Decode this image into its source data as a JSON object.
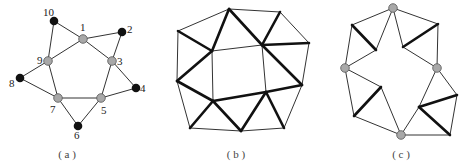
{
  "panels": [
    {
      "id": "a",
      "caption": "( a )",
      "caption_pos": [
        67,
        158
      ],
      "nodes": [
        {
          "id": "1",
          "label": "1",
          "x": 83,
          "y": 39,
          "color": "gray",
          "lx": 80,
          "ly": 31
        },
        {
          "id": "2",
          "label": "2",
          "x": 122,
          "y": 32,
          "color": "black",
          "lx": 127,
          "ly": 33
        },
        {
          "id": "3",
          "label": "3",
          "x": 112,
          "y": 61,
          "color": "gray",
          "lx": 117,
          "ly": 65
        },
        {
          "id": "4",
          "label": "4",
          "x": 136,
          "y": 88,
          "color": "black",
          "lx": 140,
          "ly": 92
        },
        {
          "id": "5",
          "label": "5",
          "x": 101,
          "y": 98,
          "color": "gray",
          "lx": 101,
          "ly": 114
        },
        {
          "id": "6",
          "label": "6",
          "x": 78,
          "y": 126,
          "color": "black",
          "lx": 74,
          "ly": 139
        },
        {
          "id": "7",
          "label": "7",
          "x": 58,
          "y": 98,
          "color": "gray",
          "lx": 50,
          "ly": 113
        },
        {
          "id": "8",
          "label": "8",
          "x": 20,
          "y": 78,
          "color": "black",
          "lx": 9,
          "ly": 87
        },
        {
          "id": "9",
          "label": "9",
          "x": 48,
          "y": 61,
          "color": "gray",
          "lx": 37,
          "ly": 64
        },
        {
          "id": "10",
          "label": "10",
          "x": 54,
          "y": 21,
          "color": "black",
          "lx": 43,
          "ly": 16
        }
      ],
      "edges": [
        [
          "10",
          "1"
        ],
        [
          "10",
          "9"
        ],
        [
          "1",
          "2"
        ],
        [
          "1",
          "9"
        ],
        [
          "1",
          "3"
        ],
        [
          "2",
          "3"
        ],
        [
          "3",
          "4"
        ],
        [
          "3",
          "5"
        ],
        [
          "4",
          "5"
        ],
        [
          "5",
          "7"
        ],
        [
          "5",
          "6"
        ],
        [
          "6",
          "7"
        ],
        [
          "7",
          "9"
        ],
        [
          "7",
          "8"
        ],
        [
          "8",
          "9"
        ]
      ]
    },
    {
      "id": "b",
      "caption": "( b )",
      "caption_pos": [
        236,
        158
      ],
      "points": {
        "T": [
          229,
          9
        ],
        "TR": [
          280,
          12
        ],
        "LU": [
          178,
          31
        ],
        "RU": [
          309,
          43
        ],
        "IUL": [
          212,
          51
        ],
        "IUR": [
          262,
          45
        ],
        "LM": [
          177,
          81
        ],
        "RM": [
          302,
          85
        ],
        "ILL": [
          213,
          101
        ],
        "ILR": [
          266,
          92
        ],
        "BL": [
          190,
          128
        ],
        "BM": [
          241,
          131
        ],
        "BR": [
          284,
          128
        ]
      },
      "thin_edges": [
        [
          "T",
          "TR"
        ],
        [
          "LU",
          "T"
        ],
        [
          "TR",
          "RU"
        ],
        [
          "LU",
          "LM"
        ],
        [
          "RU",
          "RM"
        ],
        [
          "IUL",
          "IUR"
        ],
        [
          "IUL",
          "ILL"
        ],
        [
          "IUR",
          "ILR"
        ],
        [
          "LM",
          "BL"
        ],
        [
          "BL",
          "BM"
        ],
        [
          "BM",
          "BR"
        ],
        [
          "BR",
          "RM"
        ]
      ],
      "bold_edges": [
        [
          "T",
          "IUL"
        ],
        [
          "T",
          "IUR"
        ],
        [
          "TR",
          "IUR"
        ],
        [
          "IUR",
          "RU"
        ],
        [
          "LU",
          "IUL"
        ],
        [
          "IUL",
          "LM"
        ],
        [
          "IUR",
          "RM"
        ],
        [
          "ILR",
          "RM"
        ],
        [
          "LM",
          "ILL"
        ],
        [
          "ILL",
          "BL"
        ],
        [
          "ILL",
          "BM"
        ],
        [
          "BM",
          "ILR"
        ],
        [
          "ILR",
          "BR"
        ],
        [
          "ILL",
          "ILR"
        ]
      ]
    },
    {
      "id": "c",
      "caption": "( c )",
      "caption_pos": [
        401,
        158
      ],
      "points": {
        "TG": [
          393,
          8
        ],
        "UL": [
          352,
          25
        ],
        "IUL": [
          376,
          50
        ],
        "LG": [
          345,
          68
        ],
        "UR": [
          438,
          24
        ],
        "IUR": [
          403,
          47
        ],
        "RG": [
          437,
          68
        ],
        "ILL": [
          381,
          87
        ],
        "LL": [
          354,
          116
        ],
        "BG": [
          401,
          135
        ],
        "ILR": [
          419,
          107
        ],
        "RL": [
          457,
          95
        ],
        "BR": [
          450,
          135
        ]
      },
      "gray_nodes": [
        "TG",
        "LG",
        "RG",
        "BG"
      ],
      "thin_edges": [
        [
          "TG",
          "UL"
        ],
        [
          "UL",
          "LG"
        ],
        [
          "TG",
          "IUL"
        ],
        [
          "IUL",
          "LG"
        ],
        [
          "TG",
          "UR"
        ],
        [
          "UR",
          "RG"
        ],
        [
          "TG",
          "IUR"
        ],
        [
          "IUR",
          "RG"
        ],
        [
          "LG",
          "ILL"
        ],
        [
          "LG",
          "LL"
        ],
        [
          "ILL",
          "BG"
        ],
        [
          "LL",
          "BG"
        ],
        [
          "RG",
          "ILR"
        ],
        [
          "RG",
          "RL"
        ],
        [
          "ILR",
          "BG"
        ],
        [
          "RL",
          "BR"
        ],
        [
          "BG",
          "BR"
        ]
      ],
      "bold_edges": [
        [
          "UL",
          "IUL"
        ],
        [
          "UR",
          "IUR"
        ],
        [
          "ILL",
          "LL"
        ],
        [
          "ILR",
          "RL"
        ],
        [
          "ILR",
          "BR"
        ]
      ]
    }
  ]
}
